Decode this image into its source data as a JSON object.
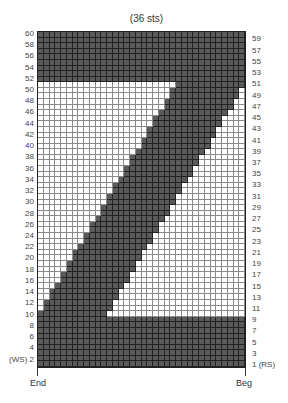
{
  "chart": {
    "title": "(36 sts)",
    "columns": 36,
    "rows": 60,
    "colors": {
      "dark": "#5a5a5a",
      "light": "#ffffff",
      "grid_dark": "#222222",
      "grid_light": "#8a8a8a"
    },
    "bottom_labels": {
      "left": "End",
      "right": "Beg"
    },
    "left_labels": [
      {
        "row": 60,
        "text": "60"
      },
      {
        "row": 58,
        "text": "58"
      },
      {
        "row": 56,
        "text": "56"
      },
      {
        "row": 54,
        "text": "54"
      },
      {
        "row": 52,
        "text": "52"
      },
      {
        "row": 50,
        "text": "50"
      },
      {
        "row": 48,
        "text": "48"
      },
      {
        "row": 46,
        "text": "46"
      },
      {
        "row": 44,
        "text": "44"
      },
      {
        "row": 42,
        "text": "42"
      },
      {
        "row": 40,
        "text": "40"
      },
      {
        "row": 38,
        "text": "38"
      },
      {
        "row": 36,
        "text": "36"
      },
      {
        "row": 34,
        "text": "34"
      },
      {
        "row": 32,
        "text": "32"
      },
      {
        "row": 30,
        "text": "30"
      },
      {
        "row": 28,
        "text": "28"
      },
      {
        "row": 26,
        "text": "26"
      },
      {
        "row": 24,
        "text": "24"
      },
      {
        "row": 22,
        "text": "22"
      },
      {
        "row": 20,
        "text": "20"
      },
      {
        "row": 18,
        "text": "18"
      },
      {
        "row": 16,
        "text": "16"
      },
      {
        "row": 14,
        "text": "14"
      },
      {
        "row": 12,
        "text": "12"
      },
      {
        "row": 10,
        "text": "10"
      },
      {
        "row": 8,
        "text": "8"
      },
      {
        "row": 6,
        "text": "6"
      },
      {
        "row": 4,
        "text": "4"
      },
      {
        "row": 2,
        "text": "(WS) 2"
      }
    ],
    "right_labels": [
      {
        "row": 59,
        "text": "59"
      },
      {
        "row": 57,
        "text": "57"
      },
      {
        "row": 55,
        "text": "55"
      },
      {
        "row": 53,
        "text": "53"
      },
      {
        "row": 51,
        "text": "51"
      },
      {
        "row": 49,
        "text": "49"
      },
      {
        "row": 47,
        "text": "47"
      },
      {
        "row": 45,
        "text": "45"
      },
      {
        "row": 43,
        "text": "43"
      },
      {
        "row": 41,
        "text": "41"
      },
      {
        "row": 39,
        "text": "39"
      },
      {
        "row": 37,
        "text": "37"
      },
      {
        "row": 35,
        "text": "35"
      },
      {
        "row": 33,
        "text": "33"
      },
      {
        "row": 31,
        "text": "31"
      },
      {
        "row": 29,
        "text": "29"
      },
      {
        "row": 27,
        "text": "27"
      },
      {
        "row": 25,
        "text": "25"
      },
      {
        "row": 23,
        "text": "23"
      },
      {
        "row": 21,
        "text": "21"
      },
      {
        "row": 19,
        "text": "19"
      },
      {
        "row": 17,
        "text": "17"
      },
      {
        "row": 15,
        "text": "15"
      },
      {
        "row": 13,
        "text": "13"
      },
      {
        "row": 11,
        "text": "11"
      },
      {
        "row": 9,
        "text": "9"
      },
      {
        "row": 7,
        "text": "7"
      },
      {
        "row": 5,
        "text": "5"
      },
      {
        "row": 3,
        "text": "3"
      },
      {
        "row": 1,
        "text": "1 (RS)"
      }
    ],
    "solid_dark_rows": [
      1,
      2,
      3,
      4,
      5,
      6,
      7,
      8,
      9,
      52,
      53,
      54,
      55,
      56,
      57,
      58,
      59,
      60
    ],
    "diagonal_rows": {
      "10": [
        1,
        12
      ],
      "11": [
        2,
        13
      ],
      "12": [
        2,
        13
      ],
      "13": [
        3,
        14
      ],
      "14": [
        3,
        14
      ],
      "15": [
        4,
        15
      ],
      "16": [
        5,
        16
      ],
      "17": [
        5,
        16
      ],
      "18": [
        6,
        17
      ],
      "19": [
        6,
        17
      ],
      "20": [
        7,
        18
      ],
      "21": [
        7,
        18
      ],
      "22": [
        8,
        19
      ],
      "23": [
        9,
        20
      ],
      "24": [
        9,
        20
      ],
      "25": [
        10,
        21
      ],
      "26": [
        10,
        21
      ],
      "27": [
        11,
        22
      ],
      "28": [
        12,
        23
      ],
      "29": [
        12,
        23
      ],
      "30": [
        13,
        24
      ],
      "31": [
        13,
        24
      ],
      "32": [
        14,
        25
      ],
      "33": [
        14,
        25
      ],
      "34": [
        15,
        26
      ],
      "35": [
        16,
        27
      ],
      "36": [
        16,
        27
      ],
      "37": [
        17,
        28
      ],
      "38": [
        17,
        28
      ],
      "39": [
        18,
        29
      ],
      "40": [
        19,
        30
      ],
      "41": [
        19,
        30
      ],
      "42": [
        20,
        31
      ],
      "43": [
        20,
        31
      ],
      "44": [
        21,
        32
      ],
      "45": [
        21,
        32
      ],
      "46": [
        22,
        33
      ],
      "47": [
        23,
        34
      ],
      "48": [
        23,
        34
      ],
      "49": [
        24,
        35
      ],
      "50": [
        24,
        35
      ],
      "51": [
        25,
        36
      ]
    }
  }
}
